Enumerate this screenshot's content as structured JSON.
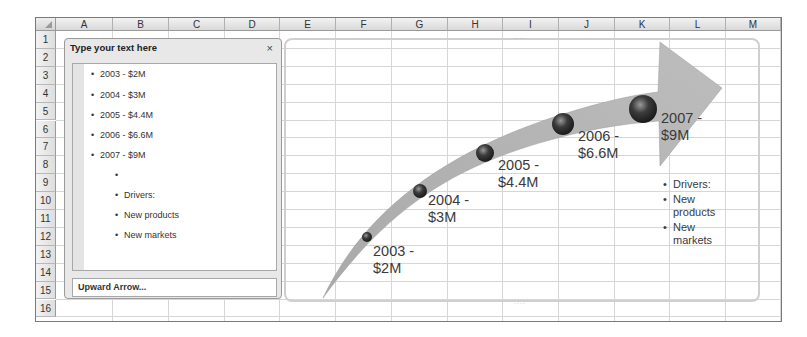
{
  "spreadsheet": {
    "columns": [
      "A",
      "B",
      "C",
      "D",
      "E",
      "F",
      "G",
      "H",
      "I",
      "J",
      "K",
      "L",
      "M"
    ],
    "rows": [
      "1",
      "2",
      "3",
      "4",
      "5",
      "6",
      "7",
      "8",
      "9",
      "10",
      "11",
      "12",
      "13",
      "14",
      "15",
      "16"
    ]
  },
  "text_pane": {
    "title": "Type your text here",
    "close_glyph": "×",
    "items": [
      {
        "text": "2003 - $2M",
        "level": 1
      },
      {
        "text": "2004 - $3M",
        "level": 1
      },
      {
        "text": "2005 - $4.4M",
        "level": 1
      },
      {
        "text": "2006 - $6.6M",
        "level": 1
      },
      {
        "text": "2007 - $9M",
        "level": 1
      },
      {
        "text": "",
        "level": 2
      },
      {
        "text": "Drivers:",
        "level": 2
      },
      {
        "text": "New products",
        "level": 2
      },
      {
        "text": "New markets",
        "level": 2
      }
    ],
    "footer": "Upward Arrow..."
  },
  "smartart": {
    "type": "Upward Arrow",
    "milestones": [
      {
        "year_line": "2003 -",
        "value_line": "$2M"
      },
      {
        "year_line": "2004 -",
        "value_line": "$3M"
      },
      {
        "year_line": "2005 -",
        "value_line": "$4.4M"
      },
      {
        "year_line": "2006 -",
        "value_line": "$6.6M"
      },
      {
        "year_line": "2007 -",
        "value_line": "$9M"
      }
    ],
    "drivers": [
      "Drivers:",
      "New products",
      "New markets"
    ],
    "arrow_color": "#b5b5b5",
    "dot_color": "#3c3c3c"
  }
}
